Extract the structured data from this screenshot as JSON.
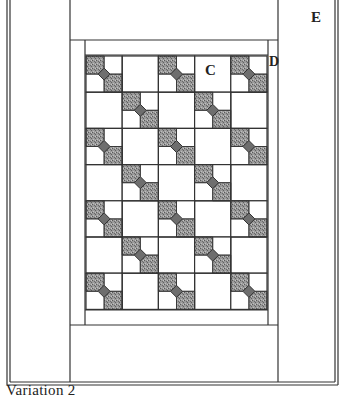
{
  "diagram": {
    "type": "quilt-layout",
    "caption": "Variation 2",
    "labels": {
      "E": "E",
      "C": "C",
      "D": "D"
    },
    "grid": {
      "columns": 5,
      "rows": 7,
      "pieced_block_rule": "checkerboard: pieced block where (row+col) is even, plain square otherwise"
    },
    "colors": {
      "line": "#333333",
      "fabric_dark": "#8a8a8a",
      "background": "#ffffff"
    }
  }
}
